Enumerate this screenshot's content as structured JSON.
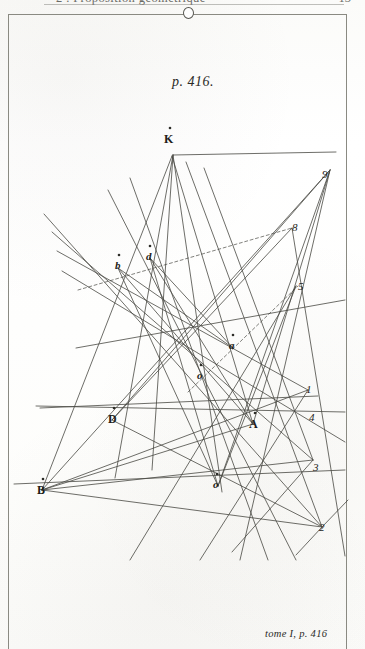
{
  "running_head": {
    "title": "2 . Proposition géométrique",
    "folio": "13"
  },
  "plate": {
    "top_caption": "p. 416.",
    "bottom_caption": "tome I, p. 416"
  },
  "figure": {
    "vertex_labels": [
      {
        "id": "K",
        "text": "K",
        "case": "upper",
        "x": 164,
        "y": 132
      },
      {
        "id": "b",
        "text": "b",
        "case": "lower",
        "x": 115,
        "y": 259
      },
      {
        "id": "d",
        "text": "d",
        "case": "lower",
        "x": 146,
        "y": 250
      },
      {
        "id": "a",
        "text": "a",
        "case": "lower",
        "x": 229,
        "y": 339
      },
      {
        "id": "o-mid",
        "text": "o",
        "case": "lower",
        "x": 197,
        "y": 369
      },
      {
        "id": "D",
        "text": "D",
        "case": "upper",
        "x": 108,
        "y": 412
      },
      {
        "id": "A",
        "text": "A",
        "case": "upper",
        "x": 249,
        "y": 417
      },
      {
        "id": "B",
        "text": "B",
        "case": "upper",
        "x": 37,
        "y": 483
      },
      {
        "id": "o-low",
        "text": "o",
        "case": "lower",
        "x": 213,
        "y": 478
      }
    ],
    "number_labels": [
      {
        "id": "n9",
        "text": "9",
        "x": 322,
        "y": 168
      },
      {
        "id": "n8",
        "text": "8",
        "x": 292,
        "y": 221
      },
      {
        "id": "n5",
        "text": "5",
        "x": 298,
        "y": 280
      },
      {
        "id": "n1",
        "text": "1",
        "x": 306,
        "y": 383
      },
      {
        "id": "n4",
        "text": "4",
        "x": 309,
        "y": 411
      },
      {
        "id": "n3",
        "text": "3",
        "x": 313,
        "y": 461
      },
      {
        "id": "n2",
        "text": "2",
        "x": 319,
        "y": 521
      }
    ],
    "solid_lines": [
      [
        173,
        155,
        115,
        478
      ],
      [
        173,
        155,
        152,
        470
      ],
      [
        173,
        155,
        222,
        492
      ],
      [
        173,
        155,
        336,
        152
      ],
      [
        42,
        490,
        172,
        156
      ],
      [
        42,
        490,
        330,
        170
      ],
      [
        42,
        490,
        308,
        390
      ],
      [
        42,
        490,
        313,
        460
      ],
      [
        42,
        490,
        322,
        527
      ],
      [
        42,
        490,
        253,
        424
      ],
      [
        14,
        484,
        345,
        470
      ],
      [
        44,
        214,
        322,
        527
      ],
      [
        52,
        232,
        313,
        460
      ],
      [
        57,
        251,
        308,
        390
      ],
      [
        62,
        271,
        345,
        442
      ],
      [
        112,
        420,
        330,
        170
      ],
      [
        112,
        420,
        322,
        527
      ],
      [
        112,
        420,
        292,
        228
      ],
      [
        253,
        424,
        118,
        268
      ],
      [
        253,
        424,
        150,
        258
      ],
      [
        253,
        424,
        330,
        170
      ],
      [
        253,
        424,
        172,
        156
      ],
      [
        218,
        486,
        118,
        268
      ],
      [
        218,
        486,
        150,
        258
      ],
      [
        218,
        486,
        330,
        170
      ],
      [
        218,
        486,
        296,
        286
      ],
      [
        118,
        268,
        233,
        348
      ],
      [
        150,
        258,
        233,
        348
      ],
      [
        296,
        286,
        130,
        560
      ],
      [
        330,
        170,
        240,
        560
      ],
      [
        36,
        406,
        345,
        412
      ],
      [
        40,
        408,
        318,
        396
      ],
      [
        108,
        190,
        296,
        560
      ],
      [
        130,
        178,
        268,
        560
      ],
      [
        186,
        162,
        322,
        527
      ],
      [
        204,
        168,
        313,
        460
      ],
      [
        76,
        348,
        345,
        300
      ],
      [
        292,
        228,
        345,
        556
      ],
      [
        322,
        527,
        348,
        500
      ],
      [
        322,
        527,
        296,
        555
      ],
      [
        308,
        390,
        200,
        560
      ],
      [
        313,
        460,
        232,
        552
      ]
    ],
    "dashed_lines": [
      [
        78,
        290,
        292,
        228
      ],
      [
        188,
        392,
        298,
        286
      ]
    ]
  },
  "colors": {
    "ink": "#3a3a34",
    "paper": "#fdfdfc",
    "frame": "#8a8a82",
    "head_text": "#6b6b66"
  }
}
